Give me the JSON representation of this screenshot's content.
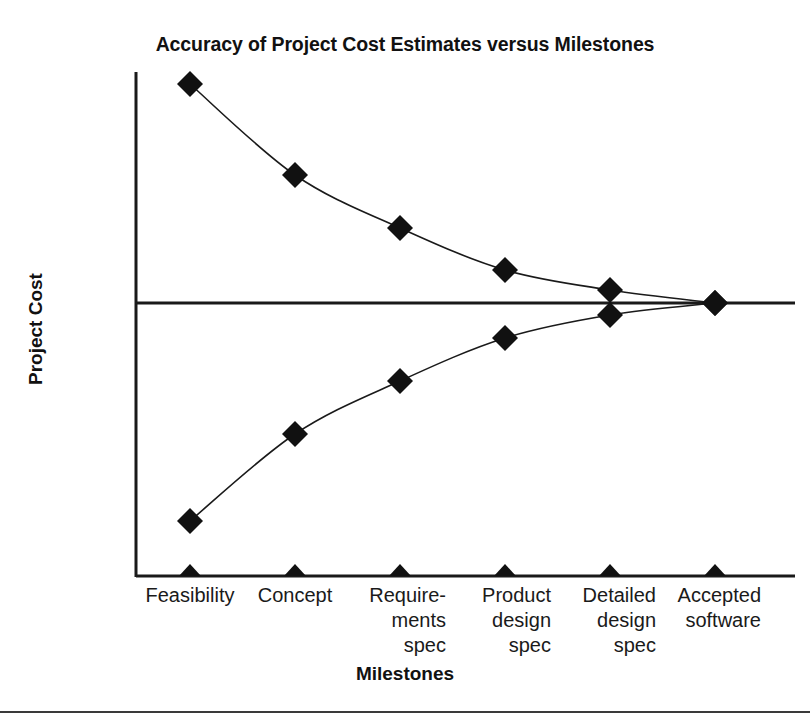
{
  "figure": {
    "title": "Accuracy of Project Cost Estimates versus Milestones",
    "x_axis_title": "Milestones",
    "y_axis_title": "Project Cost",
    "background_color": "#ffffff",
    "ink_color": "#1a1a1a",
    "bottom_rule_color": "#3a3a3a"
  },
  "chart_data": {
    "type": "line",
    "title": "Accuracy of Project Cost Estimates versus Milestones",
    "xlabel": "Milestones",
    "ylabel": "Project Cost",
    "categories": [
      "Feasibility",
      "Concept",
      "Requirements spec",
      "Product design spec",
      "Detailed design spec",
      "Accepted software"
    ],
    "category_label_lines": [
      [
        "Feasibility"
      ],
      [
        "Concept"
      ],
      [
        "Require-",
        "ments",
        "spec"
      ],
      [
        "Product",
        "design",
        "spec"
      ],
      [
        "Detailed",
        "design",
        "spec"
      ],
      [
        "Accepted",
        "software"
      ]
    ],
    "ytick_labels": [
      "4x",
      "2x",
      "1.5x",
      "1.25x",
      "1x",
      "0.8x",
      "0.67x",
      "0.5x",
      "0.25x"
    ],
    "ytick_values": [
      4,
      2,
      1.5,
      1.25,
      1,
      0.8,
      0.67,
      0.5,
      0.25
    ],
    "ytick_pixel_y": [
      84,
      175,
      228,
      270,
      303,
      338,
      381,
      434,
      521
    ],
    "reference_line": {
      "label": "1x",
      "value": 1
    },
    "grid": false,
    "legend": null,
    "marker": "filled-diamond",
    "series": [
      {
        "name": "Upper estimate bound",
        "values": [
          4,
          2,
          1.5,
          1.25,
          1.1,
          1
        ],
        "value_labels": [
          "4x",
          "2x",
          "1.5x",
          "1.25x",
          "1.1x",
          "1x"
        ],
        "pixel_points": [
          [
            190,
            84
          ],
          [
            295,
            175
          ],
          [
            400,
            228
          ],
          [
            505,
            270
          ],
          [
            610,
            290
          ],
          [
            715,
            303
          ]
        ]
      },
      {
        "name": "Lower estimate bound",
        "values": [
          0.25,
          0.5,
          0.67,
          0.8,
          0.9,
          1
        ],
        "value_labels": [
          "0.25x",
          "0.5x",
          "0.67x",
          "0.8x",
          "0.9x",
          "1x"
        ],
        "pixel_points": [
          [
            190,
            521
          ],
          [
            295,
            434
          ],
          [
            400,
            381
          ],
          [
            505,
            338
          ],
          [
            610,
            315
          ],
          [
            715,
            303
          ]
        ]
      }
    ]
  },
  "axes_geometry": {
    "x_axis_pixel_y": 576,
    "y_axis_pixel_x": 136,
    "y_axis_top_pixel_y": 72,
    "plot_right_pixel_x": 795,
    "category_pixel_x": [
      190,
      295,
      400,
      505,
      610,
      715
    ]
  }
}
